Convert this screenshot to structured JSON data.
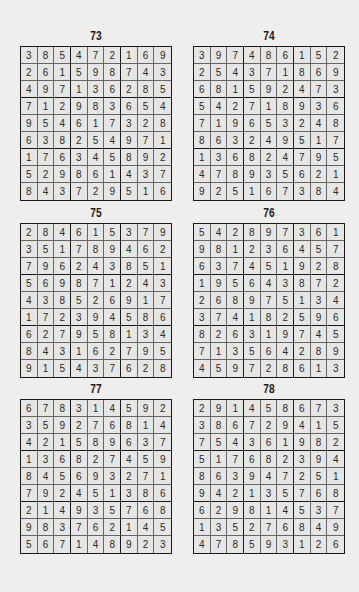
{
  "page": {
    "background": "#eeeeec",
    "ink": "#1a1a1a"
  },
  "puzzles": [
    {
      "number": "73",
      "rows": [
        [
          "3",
          "8",
          "5",
          "4",
          "7",
          "2",
          "1",
          "6",
          "9"
        ],
        [
          "2",
          "6",
          "1",
          "5",
          "9",
          "8",
          "7",
          "4",
          "3"
        ],
        [
          "4",
          "9",
          "7",
          "1",
          "3",
          "6",
          "2",
          "8",
          "5"
        ],
        [
          "7",
          "1",
          "2",
          "9",
          "8",
          "3",
          "6",
          "5",
          "4"
        ],
        [
          "9",
          "5",
          "4",
          "6",
          "1",
          "7",
          "3",
          "2",
          "8"
        ],
        [
          "6",
          "3",
          "8",
          "2",
          "5",
          "4",
          "9",
          "7",
          "1"
        ],
        [
          "1",
          "7",
          "6",
          "3",
          "4",
          "5",
          "8",
          "9",
          "2"
        ],
        [
          "5",
          "2",
          "9",
          "8",
          "6",
          "1",
          "4",
          "3",
          "7"
        ],
        [
          "8",
          "4",
          "3",
          "7",
          "2",
          "9",
          "5",
          "1",
          "6"
        ]
      ]
    },
    {
      "number": "74",
      "rows": [
        [
          "3",
          "9",
          "7",
          "4",
          "8",
          "6",
          "1",
          "5",
          "2"
        ],
        [
          "2",
          "5",
          "4",
          "3",
          "7",
          "1",
          "8",
          "6",
          "9"
        ],
        [
          "6",
          "8",
          "1",
          "5",
          "9",
          "2",
          "4",
          "7",
          "3"
        ],
        [
          "5",
          "4",
          "2",
          "7",
          "1",
          "8",
          "9",
          "3",
          "6"
        ],
        [
          "7",
          "1",
          "9",
          "6",
          "5",
          "3",
          "2",
          "4",
          "8"
        ],
        [
          "8",
          "6",
          "3",
          "2",
          "4",
          "9",
          "5",
          "1",
          "7"
        ],
        [
          "1",
          "3",
          "6",
          "8",
          "2",
          "4",
          "7",
          "9",
          "5"
        ],
        [
          "4",
          "7",
          "8",
          "9",
          "3",
          "5",
          "6",
          "2",
          "1"
        ],
        [
          "9",
          "2",
          "5",
          "1",
          "6",
          "7",
          "3",
          "8",
          "4"
        ]
      ]
    },
    {
      "number": "75",
      "rows": [
        [
          "2",
          "8",
          "4",
          "6",
          "1",
          "5",
          "3",
          "7",
          "9"
        ],
        [
          "3",
          "5",
          "1",
          "7",
          "8",
          "9",
          "4",
          "6",
          "2"
        ],
        [
          "7",
          "9",
          "6",
          "2",
          "4",
          "3",
          "8",
          "5",
          "1"
        ],
        [
          "5",
          "6",
          "9",
          "8",
          "7",
          "1",
          "2",
          "4",
          "3"
        ],
        [
          "4",
          "3",
          "8",
          "5",
          "2",
          "6",
          "9",
          "1",
          "7"
        ],
        [
          "1",
          "7",
          "2",
          "3",
          "9",
          "4",
          "5",
          "8",
          "6"
        ],
        [
          "6",
          "2",
          "7",
          "9",
          "5",
          "8",
          "1",
          "3",
          "4"
        ],
        [
          "8",
          "4",
          "3",
          "1",
          "6",
          "2",
          "7",
          "9",
          "5"
        ],
        [
          "9",
          "1",
          "5",
          "4",
          "3",
          "7",
          "6",
          "2",
          "8"
        ]
      ]
    },
    {
      "number": "76",
      "rows": [
        [
          "5",
          "4",
          "2",
          "8",
          "9",
          "7",
          "3",
          "6",
          "1"
        ],
        [
          "9",
          "8",
          "1",
          "2",
          "3",
          "6",
          "4",
          "5",
          "7"
        ],
        [
          "6",
          "3",
          "7",
          "4",
          "5",
          "1",
          "9",
          "2",
          "8"
        ],
        [
          "1",
          "9",
          "5",
          "6",
          "4",
          "3",
          "8",
          "7",
          "2"
        ],
        [
          "2",
          "6",
          "8",
          "9",
          "7",
          "5",
          "1",
          "3",
          "4"
        ],
        [
          "3",
          "7",
          "4",
          "1",
          "8",
          "2",
          "5",
          "9",
          "6"
        ],
        [
          "8",
          "2",
          "6",
          "3",
          "1",
          "9",
          "7",
          "4",
          "5"
        ],
        [
          "7",
          "1",
          "3",
          "5",
          "6",
          "4",
          "2",
          "8",
          "9"
        ],
        [
          "4",
          "5",
          "9",
          "7",
          "2",
          "8",
          "6",
          "1",
          "3"
        ]
      ]
    },
    {
      "number": "77",
      "rows": [
        [
          "6",
          "7",
          "8",
          "3",
          "1",
          "4",
          "5",
          "9",
          "2"
        ],
        [
          "3",
          "5",
          "9",
          "2",
          "7",
          "6",
          "8",
          "1",
          "4"
        ],
        [
          "4",
          "2",
          "1",
          "5",
          "8",
          "9",
          "6",
          "3",
          "7"
        ],
        [
          "1",
          "3",
          "6",
          "8",
          "2",
          "7",
          "4",
          "5",
          "9"
        ],
        [
          "8",
          "4",
          "5",
          "6",
          "9",
          "3",
          "2",
          "7",
          "1"
        ],
        [
          "7",
          "9",
          "2",
          "4",
          "5",
          "1",
          "3",
          "8",
          "6"
        ],
        [
          "2",
          "1",
          "4",
          "9",
          "3",
          "5",
          "7",
          "6",
          "8"
        ],
        [
          "9",
          "8",
          "3",
          "7",
          "6",
          "2",
          "1",
          "4",
          "5"
        ],
        [
          "5",
          "6",
          "7",
          "1",
          "4",
          "8",
          "9",
          "2",
          "3"
        ]
      ]
    },
    {
      "number": "78",
      "rows": [
        [
          "2",
          "9",
          "1",
          "4",
          "5",
          "8",
          "6",
          "7",
          "3"
        ],
        [
          "3",
          "8",
          "6",
          "7",
          "2",
          "9",
          "4",
          "1",
          "5"
        ],
        [
          "7",
          "5",
          "4",
          "3",
          "6",
          "1",
          "9",
          "8",
          "2"
        ],
        [
          "5",
          "1",
          "7",
          "6",
          "8",
          "2",
          "3",
          "9",
          "4"
        ],
        [
          "8",
          "6",
          "3",
          "9",
          "4",
          "7",
          "2",
          "5",
          "1"
        ],
        [
          "9",
          "4",
          "2",
          "1",
          "3",
          "5",
          "7",
          "6",
          "8"
        ],
        [
          "6",
          "2",
          "9",
          "8",
          "1",
          "4",
          "5",
          "3",
          "7"
        ],
        [
          "1",
          "3",
          "5",
          "2",
          "7",
          "6",
          "8",
          "4",
          "9"
        ],
        [
          "4",
          "7",
          "8",
          "5",
          "9",
          "3",
          "1",
          "2",
          "6"
        ]
      ]
    }
  ]
}
